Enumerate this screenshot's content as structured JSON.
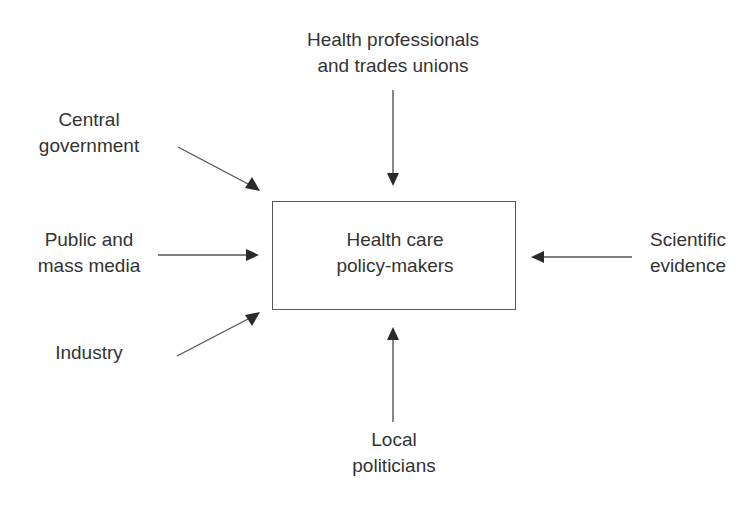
{
  "diagram": {
    "type": "influence-diagram",
    "center_node": {
      "id": "policy-makers",
      "lines": [
        "Health care",
        "policy-makers"
      ]
    },
    "influences": [
      {
        "id": "health-professionals",
        "lines": [
          "Health professionals",
          "and trades unions"
        ],
        "position": "top",
        "direction": "into-center"
      },
      {
        "id": "central-government",
        "lines": [
          "Central",
          "government"
        ],
        "position": "upper-left",
        "direction": "into-center"
      },
      {
        "id": "public-media",
        "lines": [
          "Public and",
          "mass media"
        ],
        "position": "left",
        "direction": "into-center"
      },
      {
        "id": "industry",
        "lines": [
          "Industry"
        ],
        "position": "lower-left",
        "direction": "into-center"
      },
      {
        "id": "local-politicians",
        "lines": [
          "Local",
          "politicians"
        ],
        "position": "bottom",
        "direction": "into-center"
      },
      {
        "id": "scientific-evidence",
        "lines": [
          "Scientific",
          "evidence"
        ],
        "position": "right",
        "direction": "into-center"
      }
    ],
    "colors": {
      "text": "#333333",
      "lines": "#555555",
      "arrowheads": "#2a2a2a",
      "background": "#ffffff"
    }
  }
}
